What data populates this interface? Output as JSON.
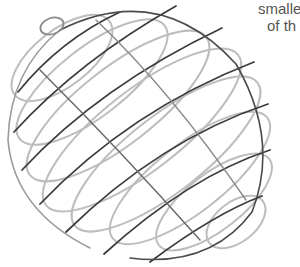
{
  "image": {
    "subject": "wire-sphere",
    "description": "Metal wire sphere made of parallel elliptical hoops",
    "colors": {
      "background": "#ffffff",
      "wire_dark": "#3a3a3a",
      "wire_light": "#b8b8b8",
      "text": "#555555"
    }
  },
  "caption": {
    "line1": "smalle",
    "line2": "of th"
  }
}
